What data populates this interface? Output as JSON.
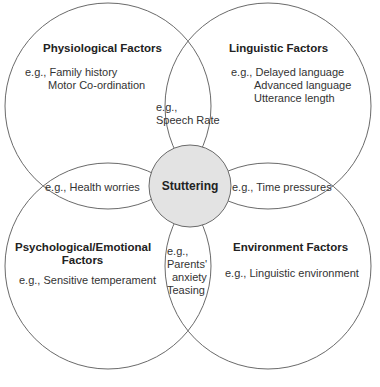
{
  "diagram": {
    "type": "venn",
    "center": {
      "label": "Stuttering",
      "fill": "#e3e3e3"
    },
    "circles": [
      {
        "title": "Physiological Factors",
        "examples": [
          "e.g., Family history",
          "Motor Co-ordination"
        ]
      },
      {
        "title": "Linguistic Factors",
        "examples": [
          "e.g., Delayed language",
          "Advanced language",
          "Utterance length"
        ]
      },
      {
        "title_line1": "Psychological/Emotional",
        "title_line2": "Factors",
        "examples": [
          "e.g., Sensitive temperament"
        ]
      },
      {
        "title": "Environment Factors",
        "examples": [
          "e.g., Linguistic environment"
        ]
      }
    ],
    "overlaps": {
      "top": [
        "e.g.,",
        "Speech Rate"
      ],
      "left": "e.g., Health worries",
      "right": "e.g., Time pressures",
      "bottom": [
        "e.g.,",
        "Parents'",
        "anxiety",
        "Teasing"
      ]
    },
    "line_color": "#6a6a6a"
  }
}
